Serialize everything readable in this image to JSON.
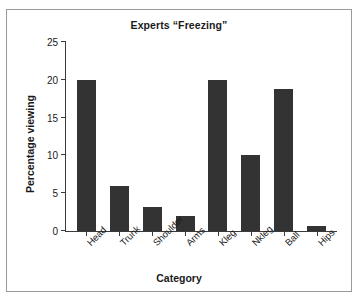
{
  "chart_data": {
    "type": "bar",
    "title": "Experts “Freezing”",
    "xlabel": "Category",
    "ylabel": "Percentage viewing",
    "categories": [
      "Head",
      "Trunk",
      "Shoulder",
      "Arms",
      "Kleg",
      "Nkleg",
      "Ball",
      "Hips"
    ],
    "values": [
      20.0,
      6.0,
      3.2,
      2.0,
      20.0,
      10.0,
      18.8,
      0.7
    ],
    "ylim": [
      0,
      25
    ],
    "yticks": [
      0,
      5,
      10,
      15,
      20,
      25
    ],
    "ytick_labels": [
      "0",
      "5",
      "10",
      "15",
      "20",
      "25"
    ],
    "grid": false,
    "legend": false,
    "bar_color": "#333333",
    "axis_color": "#3a3a3a",
    "background": "#ffffff"
  }
}
